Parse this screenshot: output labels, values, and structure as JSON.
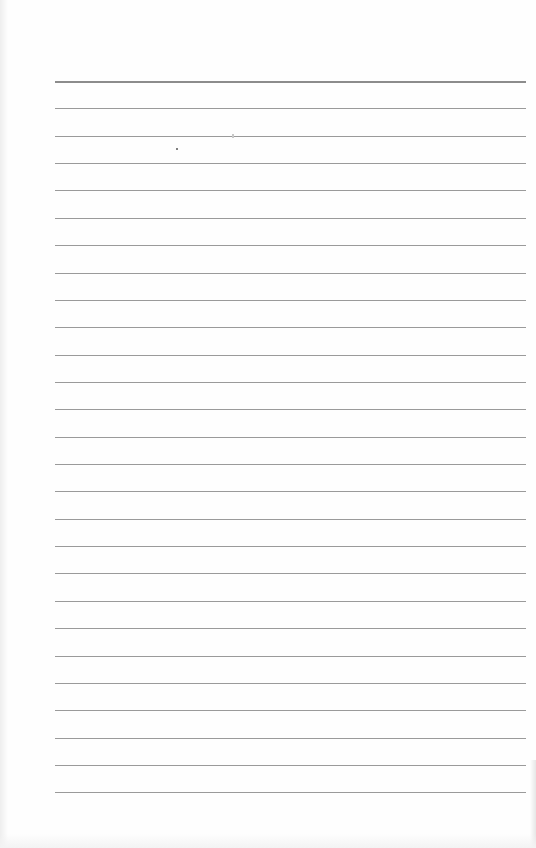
{
  "document": {
    "type": "blank lined paper",
    "text": "",
    "rule_count": 27,
    "rule_spacing_px": 27.36,
    "first_rule_y_px": 81,
    "rule_left_px": 55,
    "rule_right_px": 526,
    "colors": {
      "paper": "#fefefe",
      "rule": "#9a9a9a",
      "top_rule": "#8c8c8c"
    }
  }
}
